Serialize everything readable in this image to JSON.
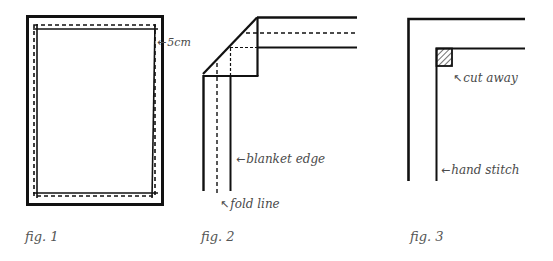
{
  "figures": [
    {
      "id": "fig1",
      "caption": "fig. 1",
      "annotations": [
        {
          "arrow": "←",
          "text": "5cm"
        }
      ]
    },
    {
      "id": "fig2",
      "caption": "fig. 2",
      "annotations": [
        {
          "arrow": "←",
          "text": "blanket edge"
        },
        {
          "arrow": "↖",
          "text": "fold line"
        }
      ]
    },
    {
      "id": "fig3",
      "caption": "fig. 3",
      "annotations": [
        {
          "arrow": "↖",
          "text": "cut away"
        },
        {
          "arrow": "←",
          "text": "hand stitch"
        }
      ]
    }
  ],
  "colors": {
    "line": "#111111",
    "text": "#4a4a4a"
  }
}
